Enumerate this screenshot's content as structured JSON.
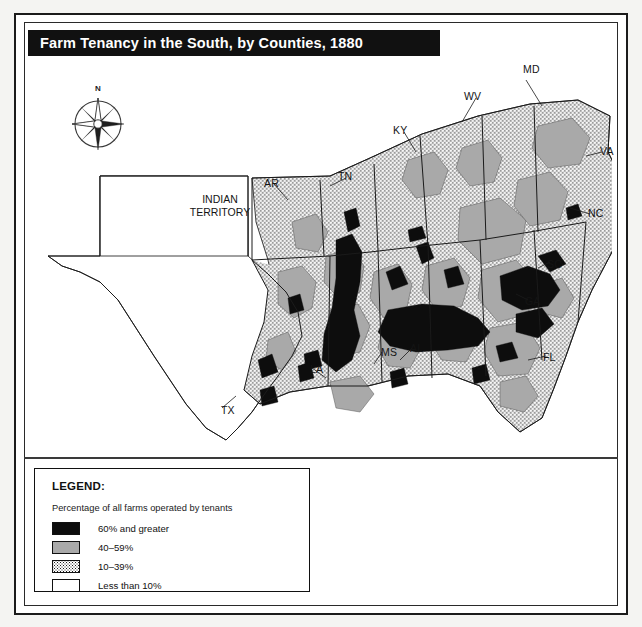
{
  "title": "Farm Tenancy in the South, by Counties, 1880",
  "compass": {
    "north_label": "N",
    "icon": "compass-rose-icon"
  },
  "territory_label": "INDIAN TERRITORY",
  "state_labels": [
    {
      "abbr": "MD",
      "x": 523,
      "y": 63
    },
    {
      "abbr": "WV",
      "x": 464,
      "y": 90
    },
    {
      "abbr": "KY",
      "x": 393,
      "y": 124
    },
    {
      "abbr": "VA",
      "x": 600,
      "y": 145
    },
    {
      "abbr": "NC",
      "x": 588,
      "y": 207
    },
    {
      "abbr": "TN",
      "x": 338,
      "y": 170
    },
    {
      "abbr": "AR",
      "x": 264,
      "y": 177
    },
    {
      "abbr": "SC",
      "x": 547,
      "y": 258
    },
    {
      "abbr": "GA",
      "x": 525,
      "y": 295
    },
    {
      "abbr": "FL",
      "x": 543,
      "y": 351
    },
    {
      "abbr": "AL",
      "x": 410,
      "y": 342
    },
    {
      "abbr": "MS",
      "x": 381,
      "y": 346
    },
    {
      "abbr": "LA",
      "x": 310,
      "y": 363
    },
    {
      "abbr": "TX",
      "x": 221,
      "y": 404
    }
  ],
  "legend": {
    "heading": "LEGEND:",
    "subtitle": "Percentage of all farms operated by tenants",
    "items": [
      {
        "swatch": "black",
        "label": "60% and  greater"
      },
      {
        "swatch": "gray",
        "label": "40–59%"
      },
      {
        "swatch": "stip",
        "label": "10–39%"
      },
      {
        "swatch": "white",
        "label": "Less than 10%"
      }
    ]
  },
  "colors": {
    "class_60_plus": "#0d0d0d",
    "class_40_59": "#a9a9a9",
    "class_10_39": "#ffffff",
    "class_under_10": "#ffffff",
    "outline": "#1b1b1b",
    "title_bar": "#111111",
    "title_text": "#ffffff"
  },
  "chart_data": {
    "type": "map",
    "title": "Farm Tenancy in the South, by Counties, 1880",
    "variable": "Percentage of all farms operated by tenants",
    "unit": "percent",
    "year": 1880,
    "classes": [
      {
        "label": "60% and  greater",
        "range": [
          60,
          100
        ],
        "fill": "#0d0d0d",
        "pattern": "solid-black"
      },
      {
        "label": "40–59%",
        "range": [
          40,
          59
        ],
        "fill": "#a9a9a9",
        "pattern": "solid-gray"
      },
      {
        "label": "10–39%",
        "range": [
          10,
          39
        ],
        "fill": "#ffffff",
        "pattern": "stipple"
      },
      {
        "label": "Less than 10%",
        "range": [
          0,
          9
        ],
        "fill": "#ffffff",
        "pattern": "none"
      }
    ],
    "regions": [
      "MD",
      "WV",
      "KY",
      "VA",
      "NC",
      "TN",
      "AR",
      "SC",
      "GA",
      "FL",
      "AL",
      "MS",
      "LA",
      "TX",
      "INDIAN TERRITORY"
    ],
    "legend_position": "bottom-left",
    "grid": false
  }
}
